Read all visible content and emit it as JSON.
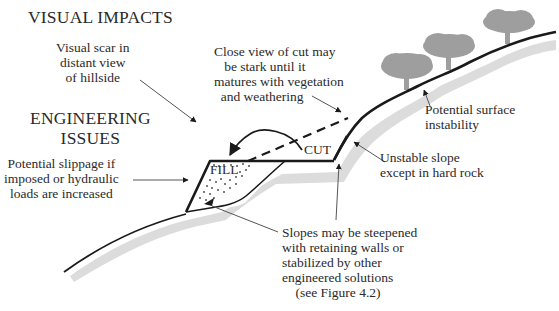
{
  "headings": {
    "visual_impacts": "VISUAL IMPACTS",
    "engineering_issues": "ENGINEERING\nISSUES"
  },
  "labels": {
    "visual_scar": "Visual scar in\ndistant view\nof hillside",
    "close_view": "Close view of cut may\n   be stark until it\nmatures with vegetation\n  and weathering",
    "potential_surface": "Potential surface\ninstability",
    "potential_slippage": "Potential slippage if\nimposed or hydraulic\nloads are increased",
    "unstable_slope": "Unstable slope\nexcept in hard rock",
    "slopes_steepened": "Slopes may be steepened\nwith retaining walls or\nstabilized by other\nengineered solutions\n    (see Figure 4.2)"
  },
  "tags": {
    "fill": "FILL",
    "cut": "CUT"
  },
  "colors": {
    "line": "#1a1a1a",
    "shadow": "#d9d9d9",
    "tree": "#9e9e9e",
    "text": "#2a2a2a"
  }
}
